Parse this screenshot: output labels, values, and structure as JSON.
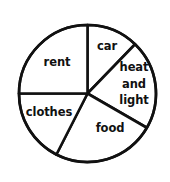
{
  "chart_data": {
    "type": "pie",
    "title": "",
    "subtitle": "",
    "xlabel": "",
    "ylabel": "",
    "grid": false,
    "legend_position": "none",
    "labels_inside_slices": true,
    "units": "percent of total",
    "categories": [
      "car",
      "heat and light",
      "food",
      "clothes",
      "rent"
    ],
    "values": [
      12.2,
      21.1,
      24.2,
      17.5,
      25.0
    ],
    "start_angle_deg": 0,
    "direction": "clockwise",
    "boundary_angles_deg": [
      0,
      44,
      120,
      207,
      270,
      360
    ],
    "slices": [
      {
        "name": "car",
        "label": "car",
        "label_lines": [
          "car"
        ],
        "start_angle_deg": 0,
        "end_angle_deg": 44,
        "sweep_deg": 44,
        "value_percent": 12.2,
        "fill": "#ffffff",
        "stroke": "#111111",
        "label_x_px": 107,
        "label_y_px": 46
      },
      {
        "name": "heat-and-light",
        "label": "heat and light",
        "label_lines": [
          "heat",
          "and",
          "light"
        ],
        "start_angle_deg": 44,
        "end_angle_deg": 120,
        "sweep_deg": 76,
        "value_percent": 21.1,
        "fill": "#ffffff",
        "stroke": "#111111",
        "label_x_px": 134,
        "label_y_px": 84
      },
      {
        "name": "food",
        "label": "food",
        "label_lines": [
          "food"
        ],
        "start_angle_deg": 120,
        "end_angle_deg": 207,
        "sweep_deg": 87,
        "value_percent": 24.2,
        "fill": "#ffffff",
        "stroke": "#111111",
        "label_x_px": 110,
        "label_y_px": 128
      },
      {
        "name": "clothes",
        "label": "clothes",
        "label_lines": [
          "clothes"
        ],
        "start_angle_deg": 207,
        "end_angle_deg": 270,
        "sweep_deg": 63,
        "value_percent": 17.5,
        "fill": "#ffffff",
        "stroke": "#111111",
        "label_x_px": 49,
        "label_y_px": 112
      },
      {
        "name": "rent",
        "label": "rent",
        "label_lines": [
          "rent"
        ],
        "start_angle_deg": 270,
        "end_angle_deg": 360,
        "sweep_deg": 90,
        "value_percent": 25.0,
        "fill": "#ffffff",
        "stroke": "#111111",
        "label_x_px": 57,
        "label_y_px": 62
      }
    ],
    "geometry": {
      "center_x_px": 87.5,
      "center_y_px": 93.5,
      "radius_px": 68.5,
      "canvas_width_px": 170,
      "canvas_height_px": 182
    },
    "colors": {
      "background": "#ffffff",
      "outline": "#111111",
      "slice_fill": "#ffffff",
      "label_text": "#111111"
    },
    "stroke_width_px": 2.6
  },
  "labels": {
    "car": "car",
    "heat_1": "heat",
    "heat_2": "and",
    "heat_3": "light",
    "food": "food",
    "clothes": "clothes",
    "rent": "rent"
  }
}
